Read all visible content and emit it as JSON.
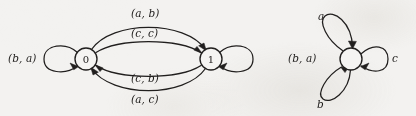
{
  "figure": {
    "background_color": "#f3f2f0",
    "ink_color": "#211f1e",
    "width": 416,
    "height": 116
  },
  "left_automaton": {
    "name": "product-automaton",
    "states": [
      {
        "id": "q0",
        "label": "0",
        "cx": 86,
        "cy": 59,
        "r": 11
      },
      {
        "id": "q1",
        "label": "1",
        "cx": 211,
        "cy": 59,
        "r": 11
      }
    ],
    "transitions": [
      {
        "id": "t-self-0",
        "from": "q0",
        "to": "q0",
        "label": "(b, a)",
        "label_x": 8,
        "label_y": 53,
        "kind": "self-loop-left"
      },
      {
        "id": "t-self-1",
        "from": "q1",
        "to": "q1",
        "label": "(b, a)",
        "label_x": 288,
        "label_y": 53,
        "kind": "self-loop-right"
      },
      {
        "id": "t-01-outer",
        "from": "q0",
        "to": "q1",
        "label": "(a, b)",
        "label_x": 131,
        "label_y": 8,
        "kind": "curve-top-outer"
      },
      {
        "id": "t-01-inner",
        "from": "q0",
        "to": "q1",
        "label": "(c, c)",
        "label_x": 131,
        "label_y": 28,
        "kind": "curve-top-inner"
      },
      {
        "id": "t-10-inner",
        "from": "q1",
        "to": "q0",
        "label": "(c, b)",
        "label_x": 131,
        "label_y": 73,
        "kind": "curve-bottom-inner"
      },
      {
        "id": "t-10-outer",
        "from": "q1",
        "to": "q0",
        "label": "(a, c)",
        "label_x": 131,
        "label_y": 94,
        "kind": "curve-bottom-outer"
      }
    ]
  },
  "right_automaton": {
    "name": "single-state-automaton",
    "states": [
      {
        "id": "s0",
        "label": "",
        "cx": 351,
        "cy": 59,
        "r": 11
      }
    ],
    "transitions": [
      {
        "id": "r-loop-a",
        "from": "s0",
        "to": "s0",
        "label": "a",
        "label_x": 318,
        "label_y": 11,
        "kind": "self-loop-upper-left"
      },
      {
        "id": "r-loop-b",
        "from": "s0",
        "to": "s0",
        "label": "b",
        "label_x": 317,
        "label_y": 99,
        "kind": "self-loop-lower-left"
      },
      {
        "id": "r-loop-c",
        "from": "s0",
        "to": "s0",
        "label": "c",
        "label_x": 392,
        "label_y": 53,
        "kind": "self-loop-right"
      }
    ]
  }
}
